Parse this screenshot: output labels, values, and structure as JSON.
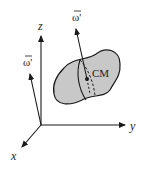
{
  "diagram": {
    "axes": {
      "x": "x",
      "y": "y",
      "z": "z"
    },
    "vectors": [
      {
        "label": "ω'",
        "description": "angular velocity vector drawn at origin"
      },
      {
        "label": "ω'",
        "description": "angular velocity vector through center of mass"
      }
    ],
    "center_of_mass_label": "CM",
    "colors": {
      "body_fill": "#c8c8c8",
      "stroke": "#1a1a1a"
    }
  }
}
